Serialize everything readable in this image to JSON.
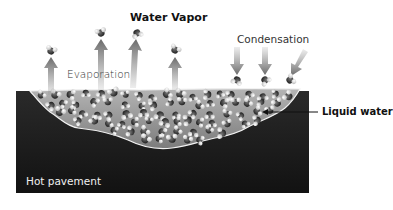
{
  "diagram": {
    "title": "Water Vapor",
    "labels": {
      "evaporation": "Evaporation",
      "condensation": "Condensation",
      "liquid_water": "Liquid water",
      "surface": "Hot pavement"
    },
    "colors": {
      "pavement": "#1c1c1c",
      "puddle": "#9a9a9a",
      "puddle_edge": "#f2f2f2",
      "arrow": "#6e6e6e",
      "molecule_oxygen": "#3a3a3a",
      "molecule_hydrogen": "#e8e8e8"
    },
    "evaporating_molecules": 4,
    "condensing_molecules": 3
  }
}
